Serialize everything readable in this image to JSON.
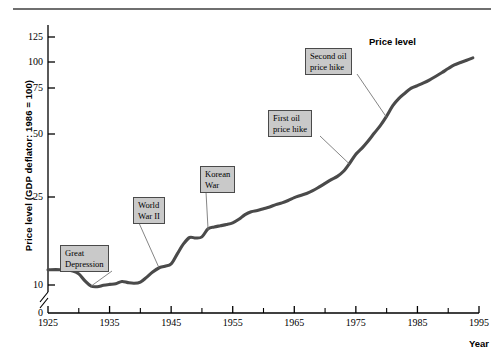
{
  "chart_data": {
    "type": "line",
    "title": "",
    "xlabel": "Year",
    "ylabel": "Price level (GDP deflator: 1986 = 100)",
    "series_label": "Price level",
    "xlim": [
      1925,
      1995
    ],
    "ylim": [
      0,
      135
    ],
    "grid": false,
    "legend_position": "inline-right",
    "y_axis_break": true,
    "y_axis_break_note": "axis broken between 0 and 10",
    "y_ticks": [
      0,
      10,
      25,
      50,
      75,
      100,
      125
    ],
    "y_tick_labels": [
      "0",
      "10",
      "25",
      "50",
      "75",
      "100",
      "125"
    ],
    "x_ticks": [
      1925,
      1935,
      1945,
      1955,
      1965,
      1975,
      1985,
      1995
    ],
    "x_tick_labels": [
      "1925",
      "1935",
      "1945",
      "1955",
      "1965",
      "1975",
      "1985",
      "1995"
    ],
    "x_minor_ticks": [
      1930,
      1940,
      1950,
      1960,
      1970,
      1980,
      1990
    ],
    "x": [
      1925,
      1927,
      1929,
      1930,
      1931,
      1932,
      1933,
      1934,
      1935,
      1936,
      1937,
      1938,
      1939,
      1940,
      1941,
      1942,
      1943,
      1944,
      1945,
      1946,
      1947,
      1948,
      1949,
      1950,
      1951,
      1952,
      1953,
      1954,
      1955,
      1956,
      1957,
      1958,
      1959,
      1960,
      1961,
      1962,
      1963,
      1964,
      1965,
      1966,
      1967,
      1968,
      1969,
      1970,
      1971,
      1972,
      1973,
      1974,
      1975,
      1976,
      1977,
      1978,
      1979,
      1980,
      1981,
      1982,
      1983,
      1984,
      1985,
      1986,
      1987,
      1988,
      1989,
      1990,
      1991,
      1992,
      1993,
      1994
    ],
    "values": [
      12.6,
      12.6,
      12.4,
      11.9,
      10.7,
      9.6,
      9.4,
      9.9,
      10.1,
      10.2,
      10.6,
      10.4,
      10.3,
      10.5,
      11.3,
      12.2,
      12.9,
      13.2,
      13.6,
      15.3,
      17.0,
      18.1,
      18.0,
      18.2,
      19.6,
      19.9,
      20.1,
      20.3,
      20.6,
      21.2,
      22.0,
      22.5,
      22.7,
      23.0,
      23.3,
      23.7,
      24.0,
      24.4,
      24.9,
      25.6,
      26.4,
      27.5,
      28.9,
      30.4,
      31.9,
      33.2,
      35.2,
      38.4,
      42.0,
      44.4,
      47.2,
      50.5,
      54.7,
      59.7,
      65.4,
      69.4,
      72.3,
      74.9,
      77.3,
      79.9,
      82.9,
      86.3,
      89.9,
      93.7,
      97.2,
      99.5,
      101.8,
      104.1
    ],
    "annotations": [
      {
        "id": "great-depression",
        "text": "Great\nDepression",
        "box_x": 60,
        "box_y": 245,
        "point_x": 1932,
        "point_y": 9.6
      },
      {
        "id": "world-war-ii",
        "text": "World\nWar II",
        "box_x": 133,
        "box_y": 197,
        "point_x": 1943,
        "point_y": 13.0
      },
      {
        "id": "korean-war",
        "text": "Korean\nWar",
        "box_x": 200,
        "box_y": 166,
        "point_x": 1951,
        "point_y": 19.4
      },
      {
        "id": "first-oil-hike",
        "text": "First oil\nprice hike",
        "box_x": 268,
        "box_y": 110,
        "point_x": 1974,
        "point_y": 38.0
      },
      {
        "id": "second-oil-hike",
        "text": "Second oil\nprice hike",
        "box_x": 305,
        "box_y": 48,
        "point_x": 1980,
        "point_y": 59.0
      }
    ]
  },
  "colors": {
    "line": "#4a4a4a",
    "axis": "#000000",
    "annotation_fill": "#c9c9c9",
    "annotation_border": "#4a4a4a",
    "rule": "#6f6f6f"
  }
}
